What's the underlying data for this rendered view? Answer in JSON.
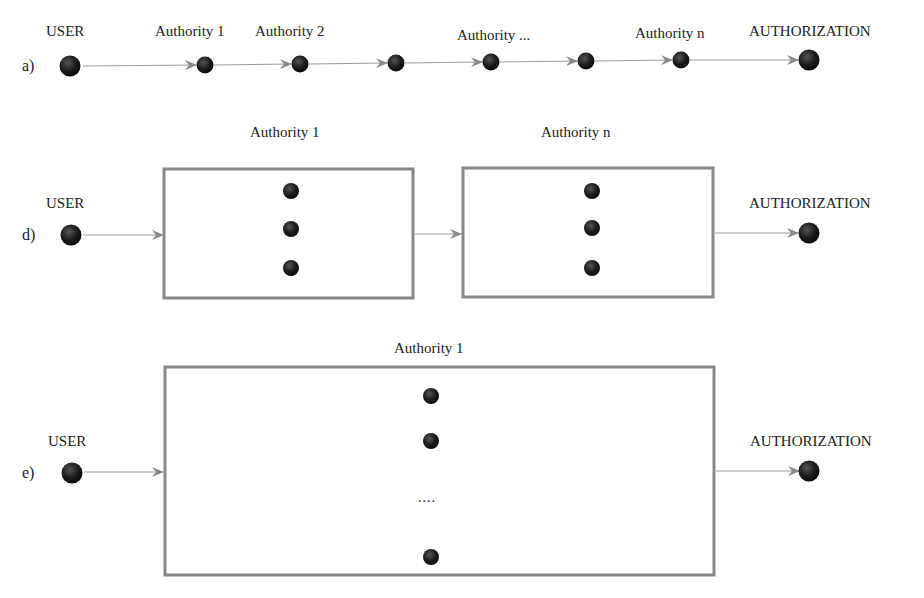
{
  "colors": {
    "node": "#1c1c1c",
    "arrow": "#8a8a8a",
    "box_border": "#888888",
    "text": "#222222"
  },
  "row_a": {
    "label": "a)",
    "nodes": [
      {
        "name": "USER",
        "x": 70
      },
      {
        "name": "Authority 1",
        "x": 205
      },
      {
        "name": "Authority 2",
        "x": 300
      },
      {
        "name": "",
        "x": 396
      },
      {
        "name": "Authority ...",
        "x": 491
      },
      {
        "name": "",
        "x": 586
      },
      {
        "name": "Authority n",
        "x": 681
      },
      {
        "name": "AUTHORIZATION",
        "x": 809
      }
    ]
  },
  "row_d": {
    "label": "d)",
    "user_label": "USER",
    "box1_label": "Authority 1",
    "box2_label": "Authority n",
    "auth_label": "AUTHORIZATION"
  },
  "row_e": {
    "label": "e)",
    "user_label": "USER",
    "box_label": "Authority 1",
    "ellipsis": "....",
    "auth_label": "AUTHORIZATION"
  }
}
